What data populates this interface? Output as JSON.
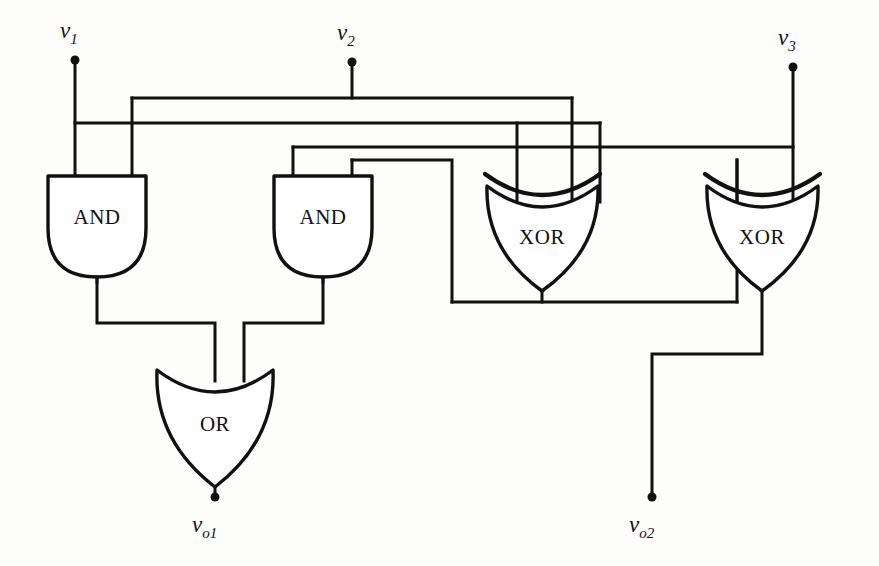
{
  "diagram": {
    "background_color": "#fdfdfc",
    "line_color": "#111111",
    "gate_fill": "#ffffff"
  },
  "gates": [
    {
      "id": "and1",
      "type": "AND",
      "label": "AND",
      "x": 48,
      "y": 175,
      "w": 98,
      "h": 102
    },
    {
      "id": "and2",
      "type": "AND",
      "label": "AND",
      "x": 274,
      "y": 175,
      "w": 98,
      "h": 102
    },
    {
      "id": "xor1",
      "type": "XOR",
      "label": "XOR",
      "x": 485,
      "y": 172,
      "w": 115,
      "h": 120
    },
    {
      "id": "xor2",
      "type": "XOR",
      "label": "XOR",
      "x": 705,
      "y": 172,
      "w": 115,
      "h": 120
    },
    {
      "id": "or1",
      "type": "OR",
      "label": "OR",
      "x": 155,
      "y": 368,
      "w": 120,
      "h": 120
    }
  ],
  "terminals": [
    {
      "id": "v1",
      "label": "v",
      "sub": "1",
      "dot_x": 75,
      "dot_y": 60,
      "label_x": 60,
      "label_y": 20,
      "kind": "input"
    },
    {
      "id": "v2",
      "label": "v",
      "sub": "2",
      "dot_x": 352,
      "dot_y": 62,
      "label_x": 337,
      "label_y": 22,
      "kind": "input"
    },
    {
      "id": "v3",
      "label": "v",
      "sub": "3",
      "dot_x": 793,
      "dot_y": 67,
      "label_x": 778,
      "label_y": 27,
      "kind": "input"
    },
    {
      "id": "vo1",
      "label": "v",
      "sub": "o1",
      "dot_x": 215,
      "dot_y": 498,
      "label_x": 193,
      "label_y": 512,
      "kind": "output"
    },
    {
      "id": "vo2",
      "label": "v",
      "sub": "o2",
      "dot_x": 652,
      "dot_y": 498,
      "label_x": 630,
      "label_y": 512,
      "kind": "output"
    }
  ],
  "bus_levels": {
    "bus_a_y": 98,
    "bus_b_y": 123,
    "bus_c_y": 147,
    "feed_low_y": 160,
    "gate_top_y": 175,
    "or_join_y": 323,
    "xor1_out_y": 302,
    "vo2_join_y": 354
  },
  "wires": [
    {
      "id": "w-v1-drop",
      "from": "v1",
      "to": "and1.in1",
      "path": "M75,60 L75,277"
    },
    {
      "id": "w-v1-bus-b",
      "from": "v1",
      "to": "bus-b-right",
      "path": "M75,123 L600,123"
    },
    {
      "id": "w-v2-drop",
      "from": "v2",
      "to": "bus-a",
      "path": "M352,62 L352,98"
    },
    {
      "id": "w-bus-a",
      "from": "bus-a-left",
      "to": "bus-a-right",
      "path": "M132,98 L572,98"
    },
    {
      "id": "w-bus-a-left-leg",
      "from": "bus-a",
      "to": "and1.in2",
      "path": "M132,98 L132,175"
    },
    {
      "id": "w-bus-a-right-leg",
      "from": "bus-a",
      "to": "xor1.in2",
      "path": "M572,98 L572,210"
    },
    {
      "id": "w-bus-b-right-leg",
      "from": "bus-b",
      "to": "xor1.in1",
      "path": "M517,123 L517,210"
    },
    {
      "id": "w-bus-c",
      "from": "and2-feed",
      "to": "xor2-right",
      "path": "M293,147 L793,147"
    },
    {
      "id": "w-bus-c-left-leg",
      "from": "bus-c",
      "to": "and2.in1",
      "path": "M293,147 L293,175"
    },
    {
      "id": "w-and2-in2-feed",
      "from": "xor1-left",
      "to": "and2.in2",
      "path": "M352,160 L450,160 L450,302"
    },
    {
      "id": "w-and2-in2-leg",
      "from": "feed-low",
      "to": "and2.in2",
      "path": "M352,160 L352,175"
    },
    {
      "id": "w-v3-drop",
      "from": "v3",
      "to": "xor2.in2",
      "path": "M793,67 L793,210"
    },
    {
      "id": "w-xor2-in1-feed",
      "from": "xor1-out",
      "to": "xor2.in1",
      "path": "M737,160 L737,210"
    },
    {
      "id": "w-xor1-out",
      "from": "xor1.out",
      "to": "split",
      "path": "M542,292 L542,302"
    },
    {
      "id": "w-xor1-out-bar",
      "from": "xor1.out",
      "to": "and2-and-xor2",
      "path": "M450,302 L737,302"
    },
    {
      "id": "w-xor2-feed-up",
      "from": "split-right",
      "to": "xor2.in1",
      "path": "M737,302 L737,160"
    },
    {
      "id": "w-and1-out",
      "from": "and1.out",
      "to": "or1.in1",
      "path": "M97,277 L97,323 L215,323 L215,380"
    },
    {
      "id": "w-and2-out",
      "from": "and2.out",
      "to": "or1.in2",
      "path": "M323,277 L323,323 L244,323 L244,380"
    },
    {
      "id": "w-or1-out",
      "from": "or1.out",
      "to": "vo1",
      "path": "M215,483 L215,498"
    },
    {
      "id": "w-xor2-out",
      "from": "xor2.out",
      "to": "vo2",
      "path": "M762,292 L762,354 L652,354 L652,498"
    }
  ]
}
